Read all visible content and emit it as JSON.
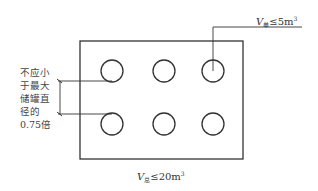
{
  "diagram": {
    "type": "tank-layout-plan",
    "tank_rows": 2,
    "tank_columns": 3,
    "tanks": [
      {
        "row": 1,
        "col": 1
      },
      {
        "row": 1,
        "col": 2
      },
      {
        "row": 1,
        "col": 3
      },
      {
        "row": 2,
        "col": 1
      },
      {
        "row": 2,
        "col": 2
      },
      {
        "row": 2,
        "col": 3
      }
    ],
    "single_volume_label": {
      "symbol": "V",
      "subscript": "单",
      "operator": "≤",
      "value": "5m",
      "exponent": "3"
    },
    "total_volume_label": {
      "symbol": "V",
      "subscript": "总",
      "operator": "≤",
      "value": "20m",
      "exponent": "3"
    },
    "spacing_note": {
      "lines": [
        "不应小",
        "于最大",
        "储罐直",
        "径的",
        "0.75倍"
      ]
    },
    "colors": {
      "stroke": "#333333",
      "background": "#ffffff"
    }
  }
}
